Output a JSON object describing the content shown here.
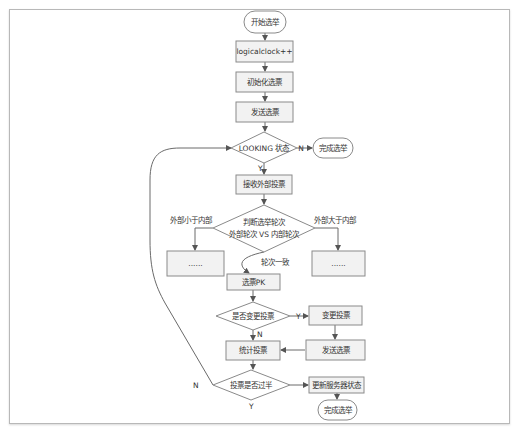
{
  "diagram": {
    "type": "flowchart",
    "colors": {
      "node_fill": "#f2f2f2",
      "stroke": "#8a8a8a",
      "edge": "#6a6a6a",
      "text": "#333333",
      "frame": "#b8b8b8"
    },
    "nodes": {
      "start": {
        "label": "开始选举",
        "shape": "terminal"
      },
      "logicalclock": {
        "label": "logicalclock++",
        "shape": "process"
      },
      "init_vote": {
        "label": "初始化选票",
        "shape": "process"
      },
      "send_vote": {
        "label": "发送选票",
        "shape": "process"
      },
      "looking": {
        "label": "LOOKING 状态",
        "shape": "decision"
      },
      "finish_top": {
        "label": "完成选举",
        "shape": "terminal"
      },
      "receive": {
        "label": "接收外部投票",
        "shape": "process"
      },
      "judge_round": {
        "label_line1": "判断选举轮次",
        "label_line2": "外部轮次 VS 内部轮次",
        "shape": "decision"
      },
      "left_box": {
        "label": "......",
        "shape": "process"
      },
      "right_box": {
        "label": "......",
        "shape": "process"
      },
      "pk": {
        "label": "选票PK",
        "shape": "process"
      },
      "change_q": {
        "label": "是否变更投票",
        "shape": "decision"
      },
      "change_vote": {
        "label": "变更投票",
        "shape": "process"
      },
      "send_vote2": {
        "label": "发送选票",
        "shape": "process"
      },
      "count": {
        "label": "统计投票",
        "shape": "process"
      },
      "majority": {
        "label": "投票是否过半",
        "shape": "decision"
      },
      "update_state": {
        "label": "更新服务器状态",
        "shape": "process"
      },
      "finish_bottom": {
        "label": "完成选举",
        "shape": "terminal"
      }
    },
    "edge_labels": {
      "looking_no": "N",
      "looking_yes": "Y",
      "ext_less": "外部小于内部",
      "ext_greater": "外部大于内部",
      "round_equal": "轮次一致",
      "change_yes": "Y",
      "change_no": "N",
      "majority_no": "N",
      "majority_yes": "Y"
    },
    "edges": [
      [
        "start",
        "logicalclock"
      ],
      [
        "logicalclock",
        "init_vote"
      ],
      [
        "init_vote",
        "send_vote"
      ],
      [
        "send_vote",
        "looking"
      ],
      [
        "looking",
        "finish_top",
        "N"
      ],
      [
        "looking",
        "receive",
        "Y"
      ],
      [
        "receive",
        "judge_round"
      ],
      [
        "judge_round",
        "left_box",
        "外部小于内部"
      ],
      [
        "judge_round",
        "right_box",
        "外部大于内部"
      ],
      [
        "judge_round",
        "pk",
        "轮次一致"
      ],
      [
        "pk",
        "change_q"
      ],
      [
        "change_q",
        "change_vote",
        "Y"
      ],
      [
        "change_q",
        "count",
        "N"
      ],
      [
        "change_vote",
        "send_vote2"
      ],
      [
        "send_vote2",
        "count"
      ],
      [
        "count",
        "majority"
      ],
      [
        "majority",
        "looking",
        "N"
      ],
      [
        "majority",
        "update_state",
        "Y"
      ],
      [
        "update_state",
        "finish_bottom"
      ]
    ]
  }
}
